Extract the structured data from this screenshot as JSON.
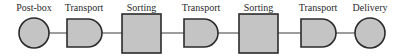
{
  "diagram": {
    "type": "process-flow",
    "colors": {
      "fill": "#c4c4c4",
      "stroke": "#2b2b2b",
      "text": "#2a2a2a"
    },
    "nodes": [
      {
        "id": "n1",
        "label": "Post-box",
        "shape": "circle"
      },
      {
        "id": "n2",
        "label": "Transport",
        "shape": "d-shape"
      },
      {
        "id": "n3",
        "label": "Sorting",
        "shape": "square"
      },
      {
        "id": "n4",
        "label": "Transport",
        "shape": "d-shape"
      },
      {
        "id": "n5",
        "label": "Sorting",
        "shape": "square"
      },
      {
        "id": "n6",
        "label": "Transport",
        "shape": "d-shape"
      },
      {
        "id": "n7",
        "label": "Delivery",
        "shape": "circle"
      }
    ],
    "edges": [
      [
        "n1",
        "n2"
      ],
      [
        "n2",
        "n3"
      ],
      [
        "n3",
        "n4"
      ],
      [
        "n4",
        "n5"
      ],
      [
        "n5",
        "n6"
      ],
      [
        "n6",
        "n7"
      ]
    ]
  }
}
